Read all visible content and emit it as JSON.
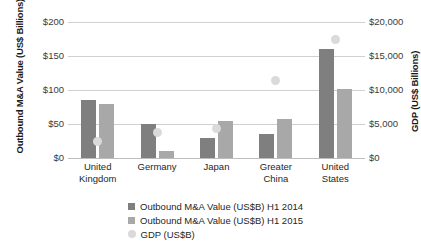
{
  "chart_data": {
    "type": "bar",
    "title": "",
    "xlabel": "",
    "ylabel": "Outbound M&A Value (US$ Billions)",
    "y2label": "GDP (US$ Billions)",
    "categories": [
      "United\nKingdom",
      "Germany",
      "Japan",
      "Greater\nChina",
      "United\nStates"
    ],
    "ylim": [
      0,
      200
    ],
    "y2lim": [
      0,
      20000
    ],
    "yticks": [
      0,
      50,
      100,
      150,
      200
    ],
    "yticklabels": [
      "$0",
      "$50",
      "$100",
      "$150",
      "$200"
    ],
    "y2ticks": [
      0,
      5000,
      10000,
      15000,
      20000
    ],
    "y2ticklabels": [
      "$0",
      "$5,000",
      "$10,000",
      "$15,000",
      "$20,000"
    ],
    "grid": true,
    "legend_position": "bottom",
    "series": [
      {
        "name": "Outbound M&A Value (US$B) H1 2014",
        "type": "bar",
        "axis": "left",
        "color": "#7f7f7f",
        "values": [
          85,
          50,
          30,
          35,
          161
        ]
      },
      {
        "name": "Outbound M&A Value (US$B) H1 2015",
        "type": "bar",
        "axis": "left",
        "color": "#a8a8a8",
        "values": [
          79,
          10,
          54,
          57,
          102
        ]
      },
      {
        "name": "GDP (US$B)",
        "type": "scatter",
        "axis": "right",
        "color": "#dadada",
        "values": [
          2500,
          3700,
          4300,
          11400,
          17400
        ]
      }
    ]
  },
  "axes": {
    "left_title": "Outbound M&A Value\n(US$ Billions)",
    "right_title": "GDP (US$ Billions)"
  },
  "legend": {
    "items": [
      {
        "label": "Outbound M&A Value (US$B) H1 2014",
        "marker": "square-dark"
      },
      {
        "label": "Outbound M&A Value (US$B) H1 2015",
        "marker": "square-light"
      },
      {
        "label": "GDP (US$B)",
        "marker": "circle-light"
      }
    ]
  }
}
